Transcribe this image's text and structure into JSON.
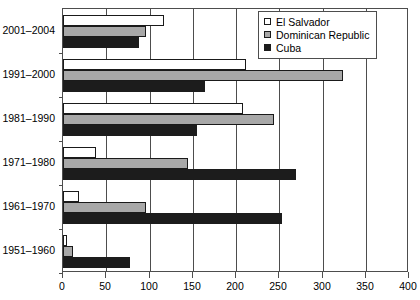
{
  "chart_data": {
    "type": "bar",
    "orientation": "horizontal",
    "title": "",
    "subtitle": "",
    "xlabel": "",
    "ylabel": "",
    "xlim": [
      0,
      400
    ],
    "xticks": [
      0,
      50,
      100,
      150,
      200,
      250,
      300,
      350,
      400
    ],
    "xtick_labels": [
      "0",
      "50",
      "100",
      "150",
      "200",
      "250",
      "300",
      "350",
      "400"
    ],
    "grid": "vertical",
    "legend_position": "top-right",
    "categories": [
      "2001–2004",
      "1991–2000",
      "1981–1990",
      "1971–1980",
      "1961–1970",
      "1951–1960"
    ],
    "series": [
      {
        "name": "El Salvador",
        "color": "#ffffff",
        "values": [
          117,
          211,
          208,
          38,
          19,
          5
        ]
      },
      {
        "name": "Dominican Republic",
        "color": "#a8a8a8",
        "values": [
          96,
          324,
          244,
          144,
          96,
          11
        ]
      },
      {
        "name": "Cuba",
        "color": "#1c1c1c",
        "values": [
          88,
          164,
          155,
          269,
          253,
          78
        ]
      }
    ]
  },
  "legend": {
    "items": [
      {
        "label": "El Salvador",
        "swatch": "white-square-icon"
      },
      {
        "label": "Dominican Republic",
        "swatch": "gray-square-icon"
      },
      {
        "label": "Cuba",
        "swatch": "black-square-icon"
      }
    ]
  },
  "colors": {
    "el_salvador": "#ffffff",
    "dominican_republic": "#a8a8a8",
    "cuba": "#1c1c1c",
    "axis": "#4d4d4d",
    "background": "#ffffff"
  }
}
